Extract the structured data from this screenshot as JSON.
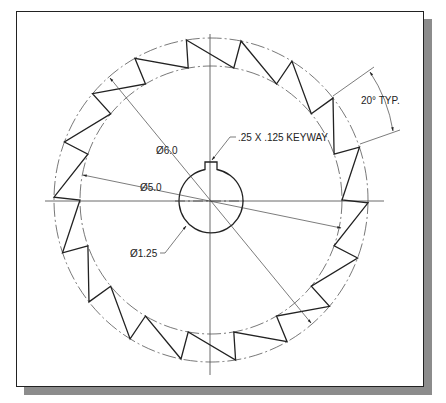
{
  "drawing": {
    "type": "sprocket / saw-tooth gear technical drawing",
    "tooth_count": 18,
    "annotations": {
      "tooth_angle": "20° TYP.",
      "keyway": ".25 X .125 KEYWAY",
      "outer_diameter": "Ø6.0",
      "root_diameter": "Ø5.0",
      "bore_diameter": "Ø1.25"
    },
    "colors": {
      "line": "#222222",
      "centerline": "#555555",
      "shadow": "#8c8c8c",
      "background": "#ffffff"
    }
  }
}
